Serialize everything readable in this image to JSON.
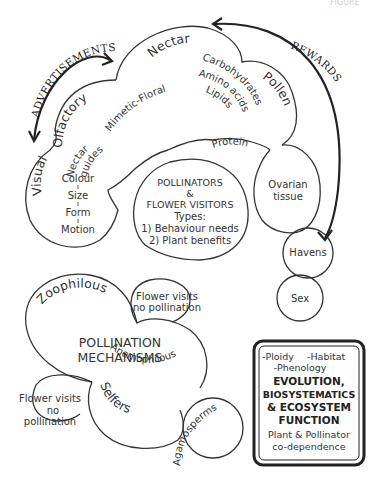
{
  "diagram": {
    "corner_text": "FIGURE",
    "arrows": {
      "advertisements": "ADVERTISEMENTS",
      "rewards": "REWARDS"
    },
    "advertisements_cloud": {
      "olfactory": "Olfactory",
      "mimetic_floral": "Mimetic-Floral",
      "nectar_guides_1": "Nectar",
      "nectar_guides_2": "guides",
      "visual": "Visual",
      "visual_traits": [
        "Colour",
        "Size",
        "Form",
        "Motion"
      ]
    },
    "rewards_cloud": {
      "nectar": "Nectar",
      "nectar_items": [
        "Carbohydrates",
        "Amino acids",
        "Lipids"
      ],
      "pollen": "Pollen",
      "protein": "Protein",
      "ovarian_tissue_1": "Ovarian",
      "ovarian_tissue_2": "tissue",
      "havens": "Havens",
      "sex": "Sex"
    },
    "pollinators": {
      "line1": "POLLINATORS",
      "line2": "&",
      "line3": "FLOWER VISITORS",
      "line4": "Types:",
      "line5": "1) Behaviour needs",
      "line6": "2) Plant benefits"
    },
    "mechanisms": {
      "title1": "POLLINATION",
      "title2": "MECHANISMS",
      "zoophilous": "Zoophilous",
      "anemophilous": "Anemophilous",
      "selfers": "Selfers",
      "agamosperms": "Agamosperms",
      "visits_top_1": "Flower visits",
      "visits_top_2": "no pollination",
      "visits_left_1": "Flower visits",
      "visits_left_2": "no",
      "visits_left_3": "pollination"
    },
    "evolution_box": {
      "ploidy": "-Ploidy",
      "habitat": "-Habitat",
      "phenology": "-Phenology",
      "title1": "EVOLUTION,",
      "title2": "BIOSYSTEMATICS",
      "title3": "& ECOSYSTEM",
      "title4": "FUNCTION",
      "footer1": "Plant & Pollinator",
      "footer2": "co-dependence"
    }
  }
}
